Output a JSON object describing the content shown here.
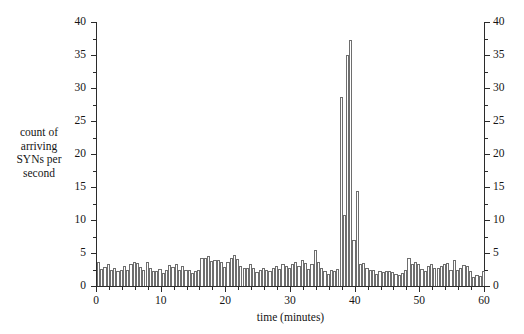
{
  "figure": {
    "background": "#ffffff",
    "ink_color": "#2b2b2b",
    "bar_edge_color": "#6e6e6e",
    "bar_fill_color": "#ffffff"
  },
  "axis_labels": {
    "y_caption_lines": [
      "count of",
      "arriving",
      "SYNs per",
      "second"
    ],
    "x_caption": "time (minutes)"
  },
  "chart_data": {
    "type": "bar",
    "title": "",
    "subtitle": "",
    "xlabel": "time (minutes)",
    "ylabel": "count of arriving SYNs per second",
    "xlim": [
      0,
      60
    ],
    "ylim": [
      0,
      40
    ],
    "grid": false,
    "legend": null,
    "bar_interval_minutes": 0.5,
    "x_ticks": [
      0,
      10,
      20,
      30,
      40,
      50,
      60
    ],
    "x_tick_labels": [
      "0",
      "10",
      "20",
      "30",
      "40",
      "50",
      "60"
    ],
    "x_minor_tick_step": 2,
    "y_ticks": [
      0,
      5,
      10,
      15,
      20,
      25,
      30,
      35,
      40
    ],
    "y_tick_labels": [
      "0",
      "5",
      "10",
      "15",
      "20",
      "25",
      "30",
      "35",
      "40"
    ],
    "y_minor_tick_step": 2.5,
    "y_axis_duplicated_right": true,
    "annotations": [
      "SYN flood spike between minutes 37 and 40, peaking at about 37 SYNs per second",
      "baseline traffic fluctuates between about 1.5 and 5 SYNs per second"
    ],
    "x": [
      0.0,
      0.5,
      1.0,
      1.5,
      2.0,
      2.5,
      3.0,
      3.5,
      4.0,
      4.5,
      5.0,
      5.5,
      6.0,
      6.5,
      7.0,
      7.5,
      8.0,
      8.5,
      9.0,
      9.5,
      10.0,
      10.5,
      11.0,
      11.5,
      12.0,
      12.5,
      13.0,
      13.5,
      14.0,
      14.5,
      15.0,
      15.5,
      16.0,
      16.5,
      17.0,
      17.5,
      18.0,
      18.5,
      19.0,
      19.5,
      20.0,
      20.5,
      21.0,
      21.5,
      22.0,
      22.5,
      23.0,
      23.5,
      24.0,
      24.5,
      25.0,
      25.5,
      26.0,
      26.5,
      27.0,
      27.5,
      28.0,
      28.5,
      29.0,
      29.5,
      30.0,
      30.5,
      31.0,
      31.5,
      32.0,
      32.5,
      33.0,
      33.5,
      34.0,
      34.5,
      35.0,
      35.5,
      36.0,
      36.5,
      37.0,
      37.5,
      38.0,
      38.5,
      39.0,
      39.5,
      40.0,
      40.5,
      41.0,
      41.5,
      42.0,
      42.5,
      43.0,
      43.5,
      44.0,
      44.5,
      45.0,
      45.5,
      46.0,
      46.5,
      47.0,
      47.5,
      48.0,
      48.5,
      49.0,
      49.5,
      50.0,
      50.5,
      51.0,
      51.5,
      52.0,
      52.5,
      53.0,
      53.5,
      54.0,
      54.5,
      55.0,
      55.5,
      56.0,
      56.5,
      57.0,
      57.5,
      58.0,
      58.5,
      59.0,
      59.5
    ],
    "values": [
      3.6,
      2.6,
      2.9,
      3.3,
      2.4,
      2.8,
      2.2,
      2.5,
      3.0,
      2.5,
      3.4,
      3.7,
      3.5,
      2.9,
      2.5,
      3.6,
      2.7,
      2.2,
      2.2,
      2.6,
      1.9,
      2.4,
      3.2,
      2.9,
      3.3,
      2.5,
      3.0,
      2.4,
      2.5,
      1.9,
      2.2,
      2.5,
      4.3,
      4.2,
      4.6,
      3.8,
      4.0,
      3.9,
      3.6,
      2.9,
      3.6,
      4.3,
      4.7,
      4.1,
      3.1,
      2.7,
      2.7,
      3.3,
      2.7,
      2.1,
      2.4,
      2.8,
      2.5,
      2.3,
      2.8,
      3.0,
      2.6,
      3.3,
      3.1,
      2.8,
      3.4,
      3.6,
      3.1,
      3.9,
      3.5,
      2.6,
      3.3,
      5.4,
      3.6,
      2.7,
      2.2,
      1.8,
      2.4,
      2.3,
      2.6,
      28.6,
      10.7,
      35.0,
      37.3,
      7.0,
      14.4,
      3.3,
      3.5,
      2.8,
      2.5,
      2.4,
      1.8,
      2.2,
      2.1,
      2.2,
      2.2,
      2.1,
      1.8,
      1.7,
      2.0,
      2.4,
      4.2,
      3.3,
      3.6,
      3.3,
      2.6,
      2.3,
      3.0,
      3.3,
      2.8,
      2.8,
      3.0,
      3.3,
      3.5,
      2.5,
      4.0,
      2.4,
      2.7,
      3.2,
      3.0,
      2.2,
      1.4,
      1.6,
      1.5,
      2.2
    ]
  }
}
